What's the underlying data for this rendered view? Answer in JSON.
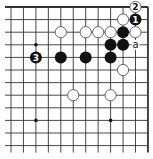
{
  "diagram": {
    "type": "go-board-fragment",
    "colors": {
      "background": "#ffffff",
      "line": "#333333",
      "black_stone": "#111111",
      "white_stone_fill": "#ffffff",
      "white_stone_stroke": "#555555"
    },
    "grid": {
      "cols": 12,
      "rows": 12,
      "x0": 11,
      "y0": 7,
      "dx": 12.45,
      "dy": 12.6,
      "edges": {
        "top": true,
        "right": true,
        "left": false,
        "bottom": false
      }
    },
    "star_points": [
      {
        "col": 2,
        "row": 3
      },
      {
        "col": 2,
        "row": 9
      },
      {
        "col": 8,
        "row": 9
      }
    ],
    "stones": [
      {
        "col": 10,
        "row": 0,
        "color": "white",
        "label": "2"
      },
      {
        "col": 9,
        "row": 1,
        "color": "white",
        "label": ""
      },
      {
        "col": 10,
        "row": 1,
        "color": "black",
        "label": "1"
      },
      {
        "col": 4,
        "row": 2,
        "color": "white",
        "label": ""
      },
      {
        "col": 6,
        "row": 2,
        "color": "white",
        "label": ""
      },
      {
        "col": 7,
        "row": 2,
        "color": "white",
        "label": ""
      },
      {
        "col": 8,
        "row": 2,
        "color": "white",
        "label": ""
      },
      {
        "col": 9,
        "row": 2,
        "color": "black",
        "label": ""
      },
      {
        "col": 10,
        "row": 2,
        "color": "white",
        "label": ""
      },
      {
        "col": 8,
        "row": 3,
        "color": "black",
        "label": ""
      },
      {
        "col": 9,
        "row": 3,
        "color": "black",
        "label": ""
      },
      {
        "col": 2,
        "row": 4,
        "color": "black",
        "label": "3"
      },
      {
        "col": 4,
        "row": 4,
        "color": "black",
        "label": ""
      },
      {
        "col": 6,
        "row": 4,
        "color": "black",
        "label": ""
      },
      {
        "col": 8,
        "row": 4,
        "color": "black",
        "label": ""
      },
      {
        "col": 9,
        "row": 5,
        "color": "white",
        "label": ""
      },
      {
        "col": 5,
        "row": 7,
        "color": "white",
        "label": ""
      },
      {
        "col": 8,
        "row": 7,
        "color": "white",
        "label": ""
      }
    ],
    "markers": [
      {
        "col": 10,
        "row": 3,
        "label": "a"
      }
    ]
  }
}
